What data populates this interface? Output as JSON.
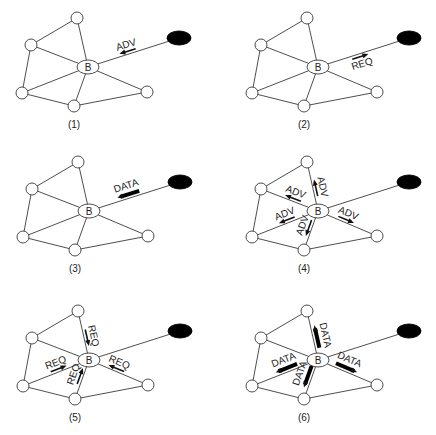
{
  "diagram": {
    "node_label": "B",
    "message_types": {
      "adv": "ADV",
      "req": "REQ",
      "data": "DATA"
    },
    "base_layout": {
      "nodes": [
        {
          "id": "top",
          "x": 77,
          "y": 18
        },
        {
          "id": "left_upper",
          "x": 31,
          "y": 45
        },
        {
          "id": "left_lower",
          "x": 22,
          "y": 93
        },
        {
          "id": "bottom",
          "x": 74,
          "y": 106
        },
        {
          "id": "right",
          "x": 147,
          "y": 92
        }
      ],
      "b_node": {
        "x": 88,
        "y": 67,
        "rx": 11,
        "ry": 7
      },
      "sink": {
        "x": 179,
        "y": 38,
        "rx": 12,
        "ry": 7
      },
      "edges": [
        [
          "top",
          "left_upper"
        ],
        [
          "top",
          "B"
        ],
        [
          "left_upper",
          "B"
        ],
        [
          "left_upper",
          "left_lower"
        ],
        [
          "left_lower",
          "B"
        ],
        [
          "left_lower",
          "bottom"
        ],
        [
          "bottom",
          "B"
        ],
        [
          "bottom",
          "right"
        ],
        [
          "right",
          "B"
        ],
        [
          "B",
          "sink"
        ]
      ]
    },
    "panels": [
      {
        "caption": "(1)",
        "dx": 0,
        "dy": 0,
        "messages": [
          {
            "label": "ADV",
            "from": "B",
            "to": "sink",
            "dir": "to_B",
            "style": "thin"
          }
        ]
      },
      {
        "caption": "(2)",
        "dx": 230,
        "dy": 0,
        "messages": [
          {
            "label": "REQ",
            "from": "B",
            "to": "sink",
            "dir": "to_sink",
            "style": "thin",
            "below": true
          }
        ]
      },
      {
        "caption": "(3)",
        "dx": 1,
        "dy": 144,
        "messages": [
          {
            "label": "DATA",
            "from": "B",
            "to": "sink",
            "dir": "to_B",
            "style": "thick"
          }
        ]
      },
      {
        "caption": "(4)",
        "dx": 230,
        "dy": 144,
        "messages": [
          {
            "label": "ADV",
            "from": "B",
            "to": "top",
            "dir": "to_top",
            "style": "thin"
          },
          {
            "label": "ADV",
            "from": "B",
            "to": "left_upper",
            "dir": "to_node",
            "style": "thin"
          },
          {
            "label": "ADV",
            "from": "B",
            "to": "left_lower",
            "dir": "to_node",
            "style": "thin"
          },
          {
            "label": "ADV",
            "from": "B",
            "to": "bottom",
            "dir": "to_node",
            "style": "thin"
          },
          {
            "label": "ADV",
            "from": "B",
            "to": "right",
            "dir": "to_node",
            "style": "thin"
          }
        ]
      },
      {
        "caption": "(5)",
        "dx": 1,
        "dy": 293,
        "messages": [
          {
            "label": "REQ",
            "from": "B",
            "to": "top",
            "dir": "to_B",
            "style": "thin"
          },
          {
            "label": "REQ",
            "from": "B",
            "to": "left_lower",
            "dir": "to_B",
            "style": "thin"
          },
          {
            "label": "REQ",
            "from": "B",
            "to": "bottom",
            "dir": "to_B",
            "style": "thin"
          },
          {
            "label": "REQ",
            "from": "B",
            "to": "right",
            "dir": "to_B",
            "style": "thin"
          }
        ]
      },
      {
        "caption": "(6)",
        "dx": 230,
        "dy": 293,
        "messages": [
          {
            "label": "DATA",
            "from": "B",
            "to": "top",
            "dir": "to_node",
            "style": "thick"
          },
          {
            "label": "DATA",
            "from": "B",
            "to": "left_lower",
            "dir": "to_node",
            "style": "thick"
          },
          {
            "label": "DATA",
            "from": "B",
            "to": "bottom",
            "dir": "to_node",
            "style": "thick"
          },
          {
            "label": "DATA",
            "from": "B",
            "to": "right",
            "dir": "to_node",
            "style": "thick"
          }
        ]
      }
    ]
  }
}
